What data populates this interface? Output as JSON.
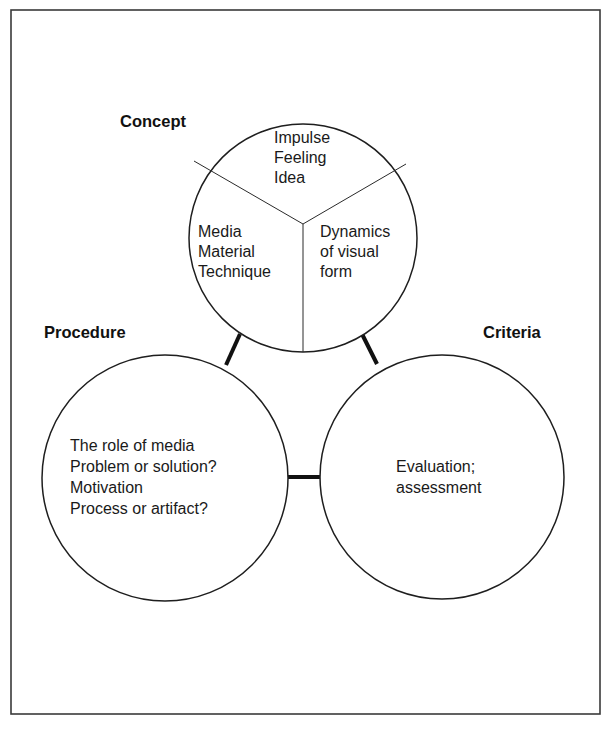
{
  "diagram": {
    "type": "three-circle concept diagram",
    "nodes": {
      "concept": {
        "label": "Concept",
        "segments": {
          "top": [
            "Impulse",
            "Feeling",
            "Idea"
          ],
          "left": [
            "Media",
            "Material",
            "Technique"
          ],
          "right": [
            "Dynamics",
            "of visual",
            "form"
          ]
        }
      },
      "procedure": {
        "label": "Procedure",
        "lines": [
          "The role of media",
          "Problem or solution?",
          "Motivation",
          "Process or artifact?"
        ]
      },
      "criteria": {
        "label": "Criteria",
        "lines": [
          "Evaluation;",
          "assessment"
        ]
      }
    },
    "edges": [
      {
        "from": "concept",
        "to": "procedure"
      },
      {
        "from": "concept",
        "to": "criteria"
      },
      {
        "from": "procedure",
        "to": "criteria"
      }
    ]
  }
}
